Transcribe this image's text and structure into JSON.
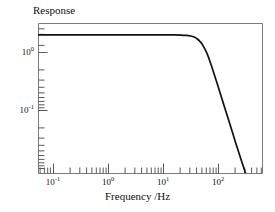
{
  "figure": {
    "title": "Response",
    "background_color": "#ffffff",
    "line_color": "#111111",
    "axis_color": "#6b6b6b"
  },
  "chart_data": {
    "type": "line",
    "title": "Response",
    "xlabel": "Frequency /Hz",
    "ylabel": "Response",
    "xscale": "log",
    "yscale": "log",
    "xlim": [
      0.05,
      600
    ],
    "ylim": [
      0.03,
      1.35
    ],
    "grid": false,
    "legend": null,
    "x_tick_labels": [
      "10-1",
      "100",
      "101",
      "102"
    ],
    "x_tick_values": [
      0.1,
      1,
      10,
      100
    ],
    "y_tick_labels": [
      "100",
      "10-1"
    ],
    "y_tick_values": [
      1,
      0.1
    ],
    "minor_ticks": true,
    "series": [
      {
        "name": "response",
        "x": [
          0.05,
          0.1,
          0.2,
          0.5,
          1,
          2,
          5,
          10,
          15,
          20,
          25,
          30,
          35,
          40,
          45,
          50,
          60,
          70,
          80,
          90,
          100,
          120,
          150,
          200,
          250,
          300,
          400,
          500,
          600
        ],
        "y": [
          1.0,
          1.0,
          1.0,
          1.0,
          1.0,
          1.0,
          1.0,
          0.999,
          0.997,
          0.993,
          0.985,
          0.97,
          0.945,
          0.9,
          0.84,
          0.77,
          0.62,
          0.48,
          0.375,
          0.3,
          0.245,
          0.172,
          0.112,
          0.064,
          0.042,
          0.03,
          0.0175,
          0.0115,
          0.0082
        ]
      }
    ]
  },
  "x_ticks": [
    {
      "label_main": "10",
      "label_exp": "-1",
      "value": 0.1
    },
    {
      "label_main": "10",
      "label_exp": "0",
      "value": 1
    },
    {
      "label_main": "10",
      "label_exp": "1",
      "value": 10
    },
    {
      "label_main": "10",
      "label_exp": "2",
      "value": 100
    }
  ],
  "y_ticks": [
    {
      "label_main": "10",
      "label_exp": "0",
      "value": 1
    },
    {
      "label_main": "10",
      "label_exp": "-1",
      "value": 0.1
    }
  ]
}
